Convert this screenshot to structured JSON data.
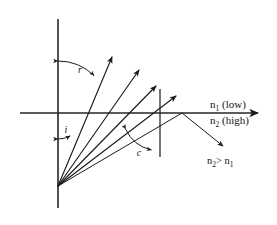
{
  "figure": {
    "background_color": "#ffffff",
    "ink_color": "#1c1c1c"
  },
  "labels": {
    "angle_refraction": "r",
    "angle_incidence": "i",
    "angle_critical": "c",
    "medium_upper_n": "n",
    "medium_upper_sub": "1",
    "medium_upper_desc": "(low)",
    "medium_lower_n": "n",
    "medium_lower_sub": "2",
    "medium_lower_desc": "(high)",
    "relation_left_n": "n",
    "relation_left_sub": "2",
    "relation_operator": ">",
    "relation_right_n": "n",
    "relation_right_sub": "1"
  },
  "geometry": {
    "source_point": {
      "x": 58,
      "y": 186
    },
    "normal_axis": {
      "x": 58,
      "y_top": 19,
      "y_bottom": 208
    },
    "interface_axis": {
      "x_left": 20,
      "x_right": 258,
      "y": 113
    },
    "boundary_marker": {
      "x": 160,
      "y_top": 89,
      "y_bottom": 157
    },
    "refracted_rays": [
      {
        "name": "refracted-ray-1",
        "x1": 58,
        "y1": 186,
        "x2": 112,
        "y2": 57
      },
      {
        "name": "refracted-ray-2",
        "x1": 58,
        "y1": 186,
        "x2": 139,
        "y2": 70
      },
      {
        "name": "refracted-ray-3",
        "x1": 58,
        "y1": 186,
        "x2": 156,
        "y2": 86
      },
      {
        "name": "refracted-ray-4",
        "x1": 58,
        "y1": 186,
        "x2": 176,
        "y2": 96
      }
    ],
    "internal_reflection": {
      "incident": {
        "x1": 58,
        "y1": 186,
        "x2": 182,
        "y2": 113
      },
      "reflected": {
        "x1": 182,
        "y1": 113,
        "x2": 223,
        "y2": 146
      }
    },
    "arc_refraction": {
      "cx": 58,
      "cy": 113,
      "radius": 52
    },
    "arc_incidence": {
      "cx": 58,
      "cy": 113,
      "radius": 26
    },
    "arc_critical": {
      "cx": 160,
      "cy": 113,
      "radius": 38
    }
  },
  "label_positions": {
    "angle_refraction": {
      "x": 80,
      "y": 73
    },
    "angle_incidence": {
      "x": 66,
      "y": 133
    },
    "angle_critical": {
      "x": 139,
      "y": 156
    },
    "medium_upper": {
      "x": 210,
      "y": 108
    },
    "medium_lower": {
      "x": 210,
      "y": 124
    },
    "relation": {
      "x": 207,
      "y": 164
    }
  }
}
